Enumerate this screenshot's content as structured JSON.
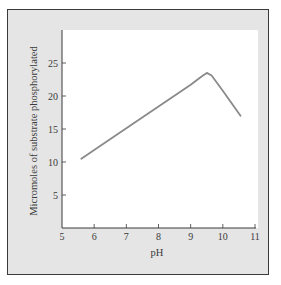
{
  "chart_data": {
    "type": "line",
    "title": "",
    "xlabel": "pH",
    "ylabel": "Micromoles of substrate phosphorylated",
    "xlim": [
      5,
      11
    ],
    "ylim": [
      0,
      30
    ],
    "x_ticks": [
      5,
      6,
      7,
      8,
      9,
      10,
      11
    ],
    "y_ticks": [
      5,
      10,
      15,
      20,
      25
    ],
    "grid": false,
    "legend": null,
    "series": [
      {
        "name": "activity",
        "x": [
          5.6,
          6.0,
          7.0,
          8.0,
          9.0,
          9.35,
          9.5,
          9.65,
          10.0,
          10.55
        ],
        "y": [
          10.5,
          11.8,
          15.1,
          18.4,
          21.7,
          23.0,
          23.5,
          23.1,
          20.8,
          17.0
        ]
      }
    ],
    "colors": {
      "line": "#8a8a8a",
      "axis": "#3a3a3a",
      "plot_bg": "#ffffff",
      "frame_bg": "#e5e5e5"
    }
  },
  "labels": {
    "x_axis": "pH",
    "y_axis": "Micromoles of substrate phosphorylated",
    "x_ticks": [
      "5",
      "6",
      "7",
      "8",
      "9",
      "10",
      "11"
    ],
    "y_ticks": [
      "5",
      "10",
      "15",
      "20",
      "25"
    ]
  }
}
